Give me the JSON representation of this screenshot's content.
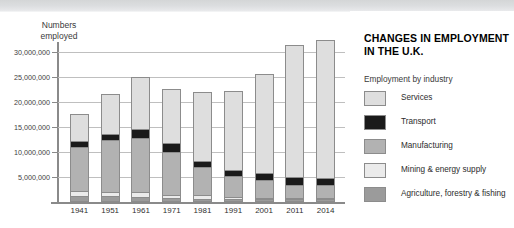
{
  "panel": {
    "title": "CHANGES IN EMPLOYMENT IN THE U.K.",
    "title_line1": "CHANGES IN EMPLOYMENT",
    "title_line2": "IN THE U.K.",
    "subtitle": "Employment by industry"
  },
  "axis": {
    "y_title": "Numbers\nemployed",
    "y_ticks": [
      "5,000,000",
      "10,000,000",
      "15,000,000",
      "20,000,000",
      "25,000,000",
      "30,000,000"
    ],
    "y_tick_values": [
      5000000,
      10000000,
      15000000,
      20000000,
      25000000,
      30000000
    ]
  },
  "colors": {
    "services": "#dedede",
    "transport": "#1a1a1a",
    "manufacturing": "#b2b2b2",
    "mining": "#ebebeb",
    "agriculture": "#9b9b9b",
    "gridline": "#bfbfbf",
    "axis": "#8a8a8a",
    "outline": "#8c8c8c",
    "banner": "#dcdee0",
    "background": "#ffffff"
  },
  "chart_data": {
    "type": "bar",
    "subtype": "stacked",
    "xlabel": "",
    "ylabel": "Numbers employed",
    "ylim": [
      0,
      31500000
    ],
    "ytick_interval": 5000000,
    "grid": true,
    "legend_position": "right",
    "legend_title": "Employment by industry",
    "categories": [
      "1941",
      "1951",
      "1961",
      "1971",
      "1981",
      "1991",
      "2001",
      "2011",
      "2014"
    ],
    "series": [
      {
        "name": "Agriculture, forestry & fishing",
        "color": "#9b9b9b",
        "values": [
          1100000,
          1000000,
          900000,
          600000,
          500000,
          400000,
          350000,
          400000,
          400000
        ]
      },
      {
        "name": "Mining & energy supply",
        "color": "#ebebeb",
        "values": [
          900000,
          900000,
          900000,
          700000,
          800000,
          400000,
          250000,
          200000,
          200000
        ]
      },
      {
        "name": "Manufacturing",
        "color": "#b2b2b2",
        "values": [
          9000000,
          10500000,
          11000000,
          8700000,
          5700000,
          4200000,
          3700000,
          2700000,
          2600000
        ]
      },
      {
        "name": "Transport",
        "color": "#1a1a1a",
        "values": [
          1200000,
          1200000,
          1800000,
          1800000,
          1200000,
          1300000,
          1400000,
          1500000,
          1500000
        ]
      },
      {
        "name": "Services",
        "color": "#dedede",
        "values": [
          5400000,
          8000000,
          10400000,
          10700000,
          13700000,
          15900000,
          19800000,
          26500000,
          27700000
        ]
      }
    ],
    "totals": [
      17600000,
      21600000,
      25000000,
      22500000,
      21900000,
      22200000,
      25500000,
      31300000,
      32400000
    ]
  },
  "legend_items": [
    {
      "label": "Services",
      "color": "#dedede"
    },
    {
      "label": "Transport",
      "color": "#1a1a1a"
    },
    {
      "label": "Manufacturing",
      "color": "#b2b2b2"
    },
    {
      "label": "Mining & energy supply",
      "color": "#ebebeb"
    },
    {
      "label": "Agriculture, forestry & fishing",
      "color": "#9b9b9b"
    }
  ]
}
